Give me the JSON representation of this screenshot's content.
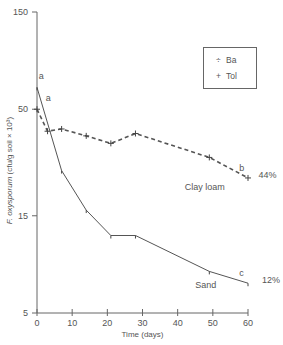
{
  "chart_data": {
    "type": "line",
    "title": "",
    "xlabel": "Time  (days)",
    "ylabel": "F. oxysporum (cfu/g soil × 10³)",
    "ylabel_italic_part": "F. oxysporum",
    "ylabel_rest": " (cfu/g soil × 10³)",
    "yscale": "log",
    "xlim": [
      0,
      60
    ],
    "ylim": [
      5,
      150
    ],
    "x_ticks": [
      0,
      10,
      20,
      30,
      40,
      50,
      60
    ],
    "y_ticks": [
      5,
      15,
      50,
      150
    ],
    "grid": false,
    "legend": {
      "position": "upper right",
      "entries": [
        {
          "symbol": "÷",
          "label": "Ba"
        },
        {
          "symbol": "+",
          "label": "Tol"
        }
      ]
    },
    "series": [
      {
        "name": "Sand",
        "style": "solid",
        "x": [
          0,
          7,
          14,
          21,
          28,
          49,
          60
        ],
        "values": [
          64,
          25,
          16,
          12,
          12,
          8,
          7
        ],
        "end_letter": "c",
        "end_percent": "12%",
        "start_letter": "a"
      },
      {
        "name": "Clay loam",
        "style": "dashed",
        "x": [
          0,
          3,
          7,
          14,
          21,
          28,
          49,
          60
        ],
        "values": [
          50,
          39,
          40,
          37,
          34,
          38,
          29,
          23
        ],
        "end_letter": "b",
        "end_percent": "44%",
        "start_letter": "a"
      }
    ],
    "annotations": [
      {
        "text": "a",
        "x": 0.5,
        "y": 70
      },
      {
        "text": "a",
        "x": 2.5,
        "y": 55
      },
      {
        "text": "Clay loam",
        "x": 42,
        "y": 20
      },
      {
        "text": "b",
        "x": 57.5,
        "y": 25
      },
      {
        "text": "44%",
        "x": 63,
        "y": 23
      },
      {
        "text": "Sand",
        "x": 45,
        "y": 6.6
      },
      {
        "text": "c",
        "x": 57.5,
        "y": 7.6
      },
      {
        "text": "12%",
        "x": 64,
        "y": 7
      }
    ]
  }
}
